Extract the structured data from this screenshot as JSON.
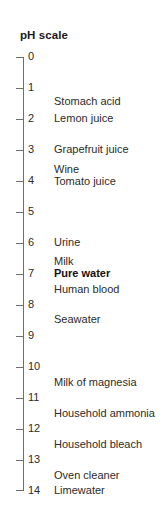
{
  "figure": {
    "title": "pH scale",
    "type": "number-line-scale",
    "axis_orientation": "vertical",
    "axis_color": "#6e6e6e",
    "text_color": "#2b2b2b",
    "background_color": "#ffffff",
    "highlight_color": "#111111"
  },
  "chart_data": {
    "type": "table",
    "title": "pH scale",
    "xlabel": "",
    "ylabel": "pH",
    "ylim": [
      0,
      14
    ],
    "grid": false,
    "legend": "none",
    "axis_orientation": "vertical-descending",
    "tick_values": [
      0,
      1,
      2,
      3,
      4,
      5,
      6,
      7,
      8,
      9,
      10,
      11,
      12,
      13,
      14
    ],
    "tick_labels": [
      "0",
      "1",
      "2",
      "3",
      "4",
      "5",
      "6",
      "7",
      "8",
      "9",
      "10",
      "11",
      "12",
      "13",
      "14"
    ],
    "categories": [
      "Stomach acid",
      "Lemon juice",
      "Grapefruit juice",
      "Wine",
      "Tomato juice",
      "Urine",
      "Milk",
      "Pure water",
      "Human blood",
      "Seawater",
      "Milk of magnesia",
      "Household ammonia",
      "Household bleach",
      "Oven cleaner",
      "Limewater"
    ],
    "values": [
      1.5,
      2.0,
      3.0,
      3.6,
      4.0,
      6.0,
      6.6,
      7.0,
      7.4,
      8.4,
      10.4,
      11.5,
      12.5,
      13.5,
      14.0
    ]
  },
  "ticks": [
    {
      "label": "0",
      "top": 51
    },
    {
      "label": "1",
      "top": 82
    },
    {
      "label": "2",
      "top": 113
    },
    {
      "label": "3",
      "top": 144
    },
    {
      "label": "4",
      "top": 175
    },
    {
      "label": "5",
      "top": 206
    },
    {
      "label": "6",
      "top": 237
    },
    {
      "label": "7",
      "top": 268
    },
    {
      "label": "8",
      "top": 299
    },
    {
      "label": "9",
      "top": 330
    },
    {
      "label": "10",
      "top": 361
    },
    {
      "label": "11",
      "top": 392
    },
    {
      "label": "12",
      "top": 423
    },
    {
      "label": "13",
      "top": 454
    },
    {
      "label": "14",
      "top": 485
    }
  ],
  "tick_line_tops": [
    57,
    88,
    119,
    150,
    181,
    212,
    243,
    274,
    305,
    336,
    367,
    398,
    429,
    460,
    490
  ],
  "substances": [
    {
      "name": "Stomach acid",
      "top": 96,
      "bold": false
    },
    {
      "name": "Lemon juice",
      "top": 113,
      "bold": false
    },
    {
      "name": "Grapefruit juice",
      "top": 144,
      "bold": false
    },
    {
      "name": "Wine",
      "top": 164,
      "bold": false
    },
    {
      "name": "Tomato juice",
      "top": 176,
      "bold": false
    },
    {
      "name": "Urine",
      "top": 237,
      "bold": false
    },
    {
      "name": "Milk",
      "top": 256,
      "bold": false
    },
    {
      "name": "Pure water",
      "top": 268,
      "bold": true
    },
    {
      "name": "Human blood",
      "top": 284,
      "bold": false
    },
    {
      "name": "Seawater",
      "top": 314,
      "bold": false
    },
    {
      "name": "Milk of magnesia",
      "top": 377,
      "bold": false
    },
    {
      "name": "Household ammonia",
      "top": 408,
      "bold": false
    },
    {
      "name": "Household bleach",
      "top": 439,
      "bold": false
    },
    {
      "name": "Oven cleaner",
      "top": 470,
      "bold": false
    },
    {
      "name": "Limewater",
      "top": 485,
      "bold": false
    }
  ]
}
